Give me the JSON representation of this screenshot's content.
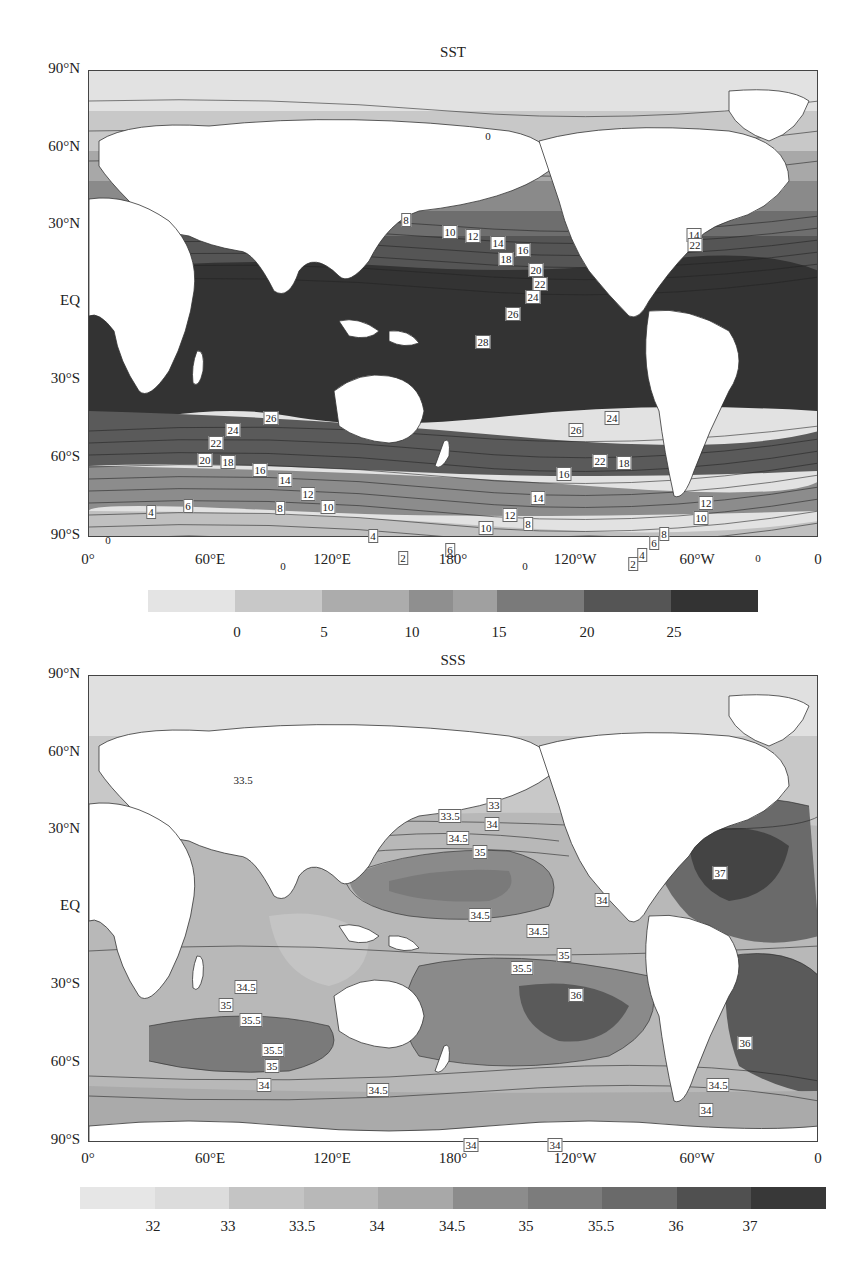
{
  "chart_data": [
    {
      "type": "heatmap",
      "title": "SST",
      "subtype": "filled contour map (global, equirectangular, 0 to 360 longitude)",
      "xlabel": "",
      "ylabel": "",
      "x_tick_labels": [
        "0°",
        "60°E",
        "120°E",
        "180°",
        "120°W",
        "60°W",
        "0"
      ],
      "y_tick_labels": [
        "90°N",
        "60°N",
        "30°N",
        "EQ",
        "30°S",
        "60°S",
        "90°S"
      ],
      "colorbar": {
        "tick_labels": [
          "0",
          "5",
          "10",
          "15",
          "20",
          "25"
        ],
        "levels": [
          -5,
          0,
          5,
          10,
          12.5,
          15,
          20,
          25,
          30
        ],
        "colors": [
          "#e4e4e4",
          "#c8c8c8",
          "#acacac",
          "#8f8f8f",
          "#a0a0a0",
          "#7a7a7a",
          "#555555",
          "#333333"
        ]
      },
      "contour_labels": [
        "0",
        "8",
        "10",
        "12",
        "14",
        "16",
        "18",
        "20",
        "22",
        "24",
        "26",
        "28",
        "26",
        "24",
        "22",
        "20",
        "18",
        "16",
        "14",
        "12",
        "10",
        "8",
        "6",
        "4",
        "2",
        "0",
        "14",
        "22",
        "12",
        "10",
        "8",
        "6",
        "4",
        "2",
        "0",
        "0",
        "4",
        "6"
      ],
      "range": [
        0,
        28
      ]
    },
    {
      "type": "heatmap",
      "title": "SSS",
      "subtype": "filled contour map (global, equirectangular, 0 to 360 longitude)",
      "xlabel": "",
      "ylabel": "",
      "x_tick_labels": [
        "0°",
        "60°E",
        "120°E",
        "180°",
        "120°W",
        "60°W",
        "0"
      ],
      "y_tick_labels": [
        "90°N",
        "60°N",
        "30°N",
        "EQ",
        "30°S",
        "60°S",
        "90°S"
      ],
      "colorbar": {
        "tick_labels": [
          "32",
          "33",
          "33.5",
          "34",
          "34.5",
          "35",
          "35.5",
          "36",
          "37"
        ],
        "colors": [
          "#e6e6e6",
          "#dcdcdc",
          "#c4c4c4",
          "#b8b8b8",
          "#a8a8a8",
          "#8c8c8c",
          "#7c7c7c",
          "#6a6a6a",
          "#505050",
          "#383838"
        ]
      },
      "contour_labels": [
        "33.5",
        "33",
        "33.5",
        "34",
        "34.5",
        "35",
        "34.5",
        "34",
        "34.5",
        "35",
        "35.5",
        "36",
        "37",
        "34.5",
        "35",
        "35.5",
        "35.5",
        "35",
        "34",
        "34.5",
        "36",
        "34.5",
        "34",
        "34",
        "34"
      ],
      "range": [
        32,
        37
      ]
    }
  ],
  "panels": {
    "sst": {
      "title": "SST",
      "y_ticks": [
        "90°N",
        "60°N",
        "30°N",
        "EQ",
        "30°S",
        "60°S",
        "90°S"
      ],
      "x_ticks": [
        "0°",
        "60°E",
        "120°E",
        "180°",
        "120°W",
        "60°W",
        "0"
      ],
      "colorbar_ticks": [
        "0",
        "5",
        "10",
        "15",
        "20",
        "25"
      ],
      "labels": [
        {
          "t": "0",
          "x": 400,
          "y": 66,
          "plain": true
        },
        {
          "t": "8",
          "x": 318,
          "y": 150
        },
        {
          "t": "10",
          "x": 362,
          "y": 162
        },
        {
          "t": "12",
          "x": 385,
          "y": 166
        },
        {
          "t": "14",
          "x": 410,
          "y": 173
        },
        {
          "t": "16",
          "x": 435,
          "y": 180
        },
        {
          "t": "18",
          "x": 418,
          "y": 189
        },
        {
          "t": "20",
          "x": 448,
          "y": 200
        },
        {
          "t": "22",
          "x": 452,
          "y": 214
        },
        {
          "t": "24",
          "x": 445,
          "y": 227
        },
        {
          "t": "26",
          "x": 425,
          "y": 244
        },
        {
          "t": "28",
          "x": 395,
          "y": 272
        },
        {
          "t": "24",
          "x": 524,
          "y": 348
        },
        {
          "t": "26",
          "x": 488,
          "y": 360
        },
        {
          "t": "22",
          "x": 512,
          "y": 391
        },
        {
          "t": "18",
          "x": 536,
          "y": 393
        },
        {
          "t": "16",
          "x": 476,
          "y": 404
        },
        {
          "t": "14",
          "x": 450,
          "y": 428
        },
        {
          "t": "12",
          "x": 422,
          "y": 445
        },
        {
          "t": "10",
          "x": 398,
          "y": 458
        },
        {
          "t": "8",
          "x": 440,
          "y": 454
        },
        {
          "t": "6",
          "x": 362,
          "y": 480
        },
        {
          "t": "4",
          "x": 285,
          "y": 466
        },
        {
          "t": "2",
          "x": 315,
          "y": 488
        },
        {
          "t": "0",
          "x": 437,
          "y": 496,
          "plain": true
        },
        {
          "t": "26",
          "x": 183,
          "y": 348
        },
        {
          "t": "24",
          "x": 145,
          "y": 360
        },
        {
          "t": "22",
          "x": 128,
          "y": 373
        },
        {
          "t": "20",
          "x": 117,
          "y": 390
        },
        {
          "t": "18",
          "x": 140,
          "y": 392
        },
        {
          "t": "16",
          "x": 172,
          "y": 400
        },
        {
          "t": "14",
          "x": 197,
          "y": 410
        },
        {
          "t": "12",
          "x": 220,
          "y": 424
        },
        {
          "t": "10",
          "x": 240,
          "y": 437
        },
        {
          "t": "8",
          "x": 192,
          "y": 438
        },
        {
          "t": "6",
          "x": 100,
          "y": 436
        },
        {
          "t": "4",
          "x": 63,
          "y": 442
        },
        {
          "t": "0",
          "x": 20,
          "y": 470,
          "plain": true
        },
        {
          "t": "0",
          "x": 195,
          "y": 496,
          "plain": true
        },
        {
          "t": "14",
          "x": 606,
          "y": 165
        },
        {
          "t": "22",
          "x": 607,
          "y": 175
        },
        {
          "t": "12",
          "x": 618,
          "y": 433
        },
        {
          "t": "10",
          "x": 613,
          "y": 448
        },
        {
          "t": "8",
          "x": 576,
          "y": 464
        },
        {
          "t": "6",
          "x": 566,
          "y": 473
        },
        {
          "t": "4",
          "x": 554,
          "y": 485
        },
        {
          "t": "2",
          "x": 545,
          "y": 494
        },
        {
          "t": "0",
          "x": 670,
          "y": 488,
          "plain": true
        }
      ]
    },
    "sss": {
      "title": "SSS",
      "y_ticks": [
        "90°N",
        "60°N",
        "30°N",
        "EQ",
        "30°S",
        "60°S",
        "90°S"
      ],
      "x_ticks": [
        "0°",
        "60°E",
        "120°E",
        "180°",
        "120°W",
        "60°W",
        "0"
      ],
      "colorbar_ticks": [
        "32",
        "33",
        "33.5",
        "34",
        "34.5",
        "35",
        "35.5",
        "36",
        "37"
      ],
      "labels": [
        {
          "t": "33.5",
          "x": 155,
          "y": 105,
          "plain": true
        },
        {
          "t": "33",
          "x": 406,
          "y": 130
        },
        {
          "t": "33.5",
          "x": 362,
          "y": 141
        },
        {
          "t": "34",
          "x": 404,
          "y": 149
        },
        {
          "t": "34.5",
          "x": 370,
          "y": 163
        },
        {
          "t": "35",
          "x": 392,
          "y": 177
        },
        {
          "t": "37",
          "x": 632,
          "y": 198
        },
        {
          "t": "34",
          "x": 514,
          "y": 225
        },
        {
          "t": "34.5",
          "x": 392,
          "y": 240
        },
        {
          "t": "34.5",
          "x": 450,
          "y": 256
        },
        {
          "t": "35",
          "x": 476,
          "y": 280
        },
        {
          "t": "35.5",
          "x": 434,
          "y": 293
        },
        {
          "t": "36",
          "x": 488,
          "y": 320
        },
        {
          "t": "34.5",
          "x": 158,
          "y": 312
        },
        {
          "t": "35",
          "x": 138,
          "y": 330
        },
        {
          "t": "35.5",
          "x": 163,
          "y": 345
        },
        {
          "t": "35.5",
          "x": 185,
          "y": 375
        },
        {
          "t": "35",
          "x": 184,
          "y": 391
        },
        {
          "t": "34",
          "x": 176,
          "y": 410
        },
        {
          "t": "34.5",
          "x": 290,
          "y": 415
        },
        {
          "t": "36",
          "x": 657,
          "y": 368
        },
        {
          "t": "34.5",
          "x": 630,
          "y": 410
        },
        {
          "t": "34",
          "x": 618,
          "y": 435
        },
        {
          "t": "34",
          "x": 383,
          "y": 470
        },
        {
          "t": "34",
          "x": 467,
          "y": 470
        }
      ]
    }
  }
}
